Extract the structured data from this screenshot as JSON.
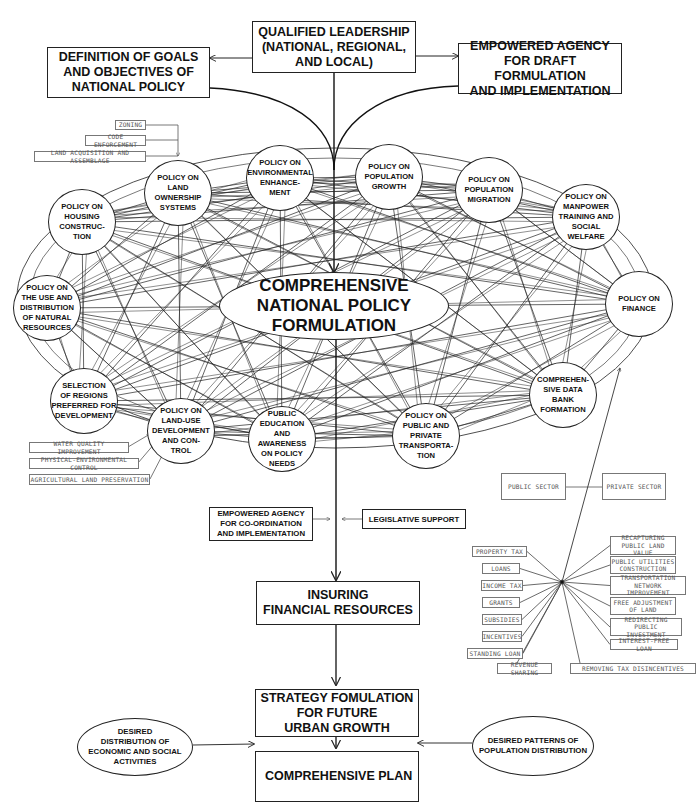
{
  "top": {
    "leadership": "QUALIFIED LEADERSHIP\n(NATIONAL, REGIONAL,\nAND LOCAL)",
    "goals": "DEFINITION OF GOALS\nAND OBJECTIVES OF\nNATIONAL POLICY",
    "draft_agency": "EMPOWERED AGENCY\nFOR DRAFT FORMULATION\nAND IMPLEMENTATION"
  },
  "center": {
    "label": "COMPREHENSIVE\nNATIONAL POLICY\nFORMULATION"
  },
  "nodes": [
    {
      "id": "land-ownership",
      "label": "POLICY ON\nLAND\nOWNERSHIP\nSYSTEMS"
    },
    {
      "id": "environmental",
      "label": "POLICY ON\nENVIRONMENTAL\nENHANCE-\nMENT"
    },
    {
      "id": "population-growth",
      "label": "POLICY ON\nPOPULATION\nGROWTH"
    },
    {
      "id": "population-migration",
      "label": "POLICY ON\nPOPULATION\nMIGRATION"
    },
    {
      "id": "manpower",
      "label": "POLICY ON\nMANPOWER\nTRAINING AND\nSOCIAL\nWELFARE"
    },
    {
      "id": "housing",
      "label": "POLICY ON\nHOUSING\nCONSTRUC-\nTION"
    },
    {
      "id": "natural-resources",
      "label": "POLICY ON\nTHE USE AND\nDISTRIBUTION\nOF NATURAL\nRESOURCES"
    },
    {
      "id": "finance",
      "label": "POLICY ON\nFINANCE"
    },
    {
      "id": "regions",
      "label": "SELECTION\nOF REGIONS\nPREFERRED FOR\nDEVELOPMENT"
    },
    {
      "id": "land-use",
      "label": "POLICY ON\nLAND-USE\nDEVELOPMENT\nAND CON-\nTROL"
    },
    {
      "id": "public-education",
      "label": "PUBLIC\nEDUCATION\nAND\nAWARENESS\nON POLICY\nNEEDS"
    },
    {
      "id": "transportation",
      "label": "POLICY ON\nPUBLIC AND\nPRIVATE\nTRANSPORTA-\nTION"
    },
    {
      "id": "data-bank",
      "label": "COMPREHEN-\nSIVE DATA\nBANK\nFORMATION"
    }
  ],
  "land_ownership_inputs": [
    "ZONING",
    "CODE ENFORCEMENT",
    "LAND ACQUISITION AND ASSEMBLAGE"
  ],
  "land_use_inputs": [
    "WATER QUALITY IMPROVEMENT",
    "PHYSICAL-ENVIRONMENTAL CONTROL",
    "AGRICULTURAL LAND PRESERVATION"
  ],
  "sectors": {
    "public": "PUBLIC SECTOR",
    "private": "PRIVATE SECTOR"
  },
  "finance_left": [
    "PROPERTY TAX",
    "LOANS",
    "INCOME TAX",
    "GRANTS",
    "SUBSIDIES",
    "INCENTIVES",
    "STANDING LOAN"
  ],
  "finance_right": [
    "RECAPTURING\nPUBLIC LAND VALUE",
    "PUBLIC UTILITIES\nCONSTRUCTION",
    "TRANSPORTATION\nNETWORK IMPROVEMENT",
    "FREE ADJUSTMENT\nOF LAND",
    "REDIRECTING PUBLIC\nINVESTMENT",
    "INTEREST-FREE LOAN"
  ],
  "finance_bottom": [
    "REVENUE SHARING",
    "REMOVING TAX DISINCENTIVES"
  ],
  "flow": {
    "coord_agency": "EMPOWERED AGENCY\nFOR CO-ORDINATION\nAND IMPLEMENTATION",
    "legislative": "LEGISLATIVE SUPPORT",
    "financial": "INSURING\nFINANCIAL RESOURCES",
    "strategy": "STRATEGY FOMULATION\nFOR FUTURE\nURBAN GROWTH",
    "econ_social": "DESIRED\nDISTRIBUTION OF\nECONOMIC AND SOCIAL\nACTIVITIES",
    "population_patterns": "DESIRED PATTERNS OF\nPOPULATION DISTRIBUTION",
    "plan": "COMPREHENSIVE PLAN"
  }
}
